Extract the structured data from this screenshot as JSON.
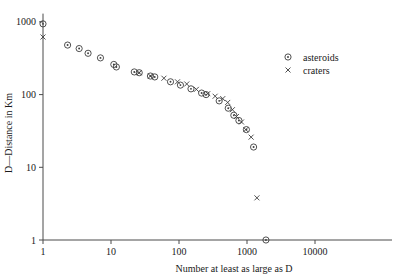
{
  "chart_data": {
    "type": "scatter",
    "title": "",
    "xlabel": "Number at least as large as D",
    "ylabel": "D—Distance in Km",
    "xscale": "log",
    "yscale": "log",
    "xlim": [
      1,
      40000
    ],
    "ylim": [
      1,
      1300
    ],
    "grid": false,
    "legend_position": "top-right",
    "xticks": [
      1,
      10,
      100,
      1000,
      10000
    ],
    "xtick_labels": [
      "1",
      "10",
      "100",
      "1000",
      "10000"
    ],
    "yticks": [
      1,
      10,
      100,
      1000
    ],
    "ytick_labels": [
      "1",
      "10",
      "100",
      "1000"
    ],
    "series": [
      {
        "name": "asteroids",
        "marker": "circle-dot",
        "points": [
          [
            1.0,
            940
          ],
          [
            2.3,
            480
          ],
          [
            3.4,
            430
          ],
          [
            4.6,
            370
          ],
          [
            7.0,
            320
          ],
          [
            11.0,
            260
          ],
          [
            12.0,
            240
          ],
          [
            22.0,
            205
          ],
          [
            26.0,
            200
          ],
          [
            38.0,
            180
          ],
          [
            44.0,
            175
          ],
          [
            75.0,
            150
          ],
          [
            105.0,
            135
          ],
          [
            150.0,
            120
          ],
          [
            215.0,
            105
          ],
          [
            250.0,
            100
          ],
          [
            390.0,
            82
          ],
          [
            530.0,
            65
          ],
          [
            640.0,
            52
          ],
          [
            760.0,
            44
          ],
          [
            980.0,
            33
          ],
          [
            1250.0,
            19
          ],
          [
            1900.0,
            1.0
          ]
        ]
      },
      {
        "name": "craters",
        "marker": "x",
        "points": [
          [
            1.0,
            620
          ],
          [
            26.0,
            200
          ],
          [
            38.0,
            180
          ],
          [
            60.0,
            168
          ],
          [
            95.0,
            150
          ],
          [
            130.0,
            140
          ],
          [
            180.0,
            118
          ],
          [
            265.0,
            103
          ],
          [
            340.0,
            95
          ],
          [
            440.0,
            88
          ],
          [
            520.0,
            78
          ],
          [
            610.0,
            62
          ],
          [
            700.0,
            50
          ],
          [
            830.0,
            42
          ],
          [
            960.0,
            33
          ],
          [
            1150.0,
            26
          ],
          [
            1400.0,
            3.8
          ]
        ]
      }
    ]
  },
  "legend": {
    "items": [
      {
        "label": "asteroids",
        "marker": "circle-dot"
      },
      {
        "label": "craters",
        "marker": "x"
      }
    ]
  }
}
